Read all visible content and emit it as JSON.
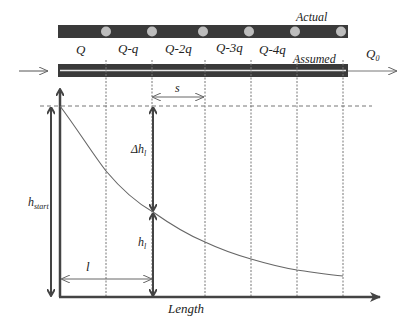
{
  "diagram": {
    "actual_bar": {
      "label": "Actual",
      "outlet_count": 6
    },
    "assumed_pipe": {
      "label": "Assumed"
    },
    "flow_labels": [
      "Q",
      "Q-q",
      "Q-2q",
      "Q-3q",
      "Q-4q"
    ],
    "outflow": {
      "label_main": "Q",
      "label_sub": "0"
    },
    "dimensions": {
      "spacing": "s",
      "length_segment": "l",
      "head_start_main": "h",
      "head_start_sub": "start",
      "head_loss_main": "Δh",
      "head_loss_sub": "l",
      "head_main": "h",
      "head_sub": "l"
    },
    "axis": {
      "xlabel": "Length"
    },
    "colors": {
      "bar_fill": "#3a3a3a",
      "outlet_fill": "#bdbdbd",
      "line": "#555555",
      "dotted": "#777777"
    }
  }
}
